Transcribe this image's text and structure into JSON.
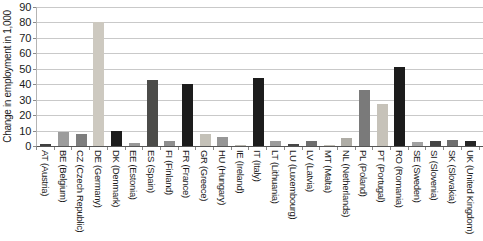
{
  "chart_data": {
    "type": "bar",
    "title": "",
    "xlabel": "",
    "ylabel": "Change in employment in 1,000",
    "ylim": [
      0,
      90
    ],
    "yticks": [
      0,
      10,
      20,
      30,
      40,
      50,
      60,
      70,
      80,
      90
    ],
    "grid": "horizontal",
    "legend": "none",
    "categories": [
      "AT (Austria)",
      "BE (Belgium)",
      "CZ (Czech Republic)",
      "DE (Germany)",
      "DK (Denmark)",
      "EE (Estonia)",
      "ES (Spain)",
      "FI (Finland)",
      "FR (France)",
      "GR (Greece)",
      "HU (Hungary)",
      "IE (Ireland)",
      "IT (Italy)",
      "LT (Lithuania)",
      "LU (Luxembourg)",
      "LV (Latvia)",
      "MT (Malta)",
      "NL (Netherlands)",
      "PL (Poland)",
      "PT (Portugal)",
      "RO (Romania)",
      "SE (Sweden)",
      "SI (Slovenia)",
      "SK (Slovakia)",
      "UK (United Kingdom)"
    ],
    "values": [
      1,
      9,
      8,
      80,
      10,
      2,
      43,
      3,
      40,
      8,
      6,
      0.5,
      44,
      3,
      1.5,
      3.5,
      0.3,
      5,
      36,
      27,
      51,
      2.5,
      3.5,
      4,
      3
    ],
    "bar_colors": [
      "#404040",
      "#9c9c9c",
      "#7e7e7e",
      "#cdc9c0",
      "#1c1c1c",
      "#999999",
      "#4b4b49",
      "#8f8f8f",
      "#1c1c1c",
      "#c4c1b8",
      "#969696",
      "#bcb9b1",
      "#1c1c1c",
      "#9c9c9c",
      "#474747",
      "#6f6f6f",
      "#c4c1b8",
      "#aeaca5",
      "#7a7a7a",
      "#c6c2b9",
      "#1c1c1c",
      "#a2a2a2",
      "#454545",
      "#6f6f6f",
      "#262626"
    ],
    "axis_color": "#555555",
    "gridline_color": "#c9c9c9",
    "text_color": "#1a1a1a"
  }
}
